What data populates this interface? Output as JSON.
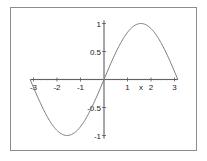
{
  "chart_data": {
    "type": "line",
    "title": "",
    "xlabel": "x",
    "ylabel": "",
    "xlim": [
      -3.1416,
      3.1416
    ],
    "ylim": [
      -1,
      1
    ],
    "grid": false,
    "legend": null,
    "x_ticks": [
      -3,
      -2,
      -1,
      1,
      2,
      3
    ],
    "x_tick_labels": [
      "-3",
      "-2",
      "-1",
      "1",
      "2",
      "3"
    ],
    "y_ticks": [
      1,
      0.5,
      -0.5,
      -1
    ],
    "y_tick_labels": [
      "1",
      "0.5",
      "-0.5",
      "-1"
    ],
    "series": [
      {
        "name": "sin(x)",
        "color": "#7a7a7a",
        "x": [
          -3.1416,
          -2.5,
          -2.0,
          -1.5708,
          -1.0,
          -0.5,
          0,
          0.5,
          1.0,
          1.5708,
          2.0,
          2.5,
          3.1416
        ],
        "y": [
          0,
          -0.598,
          -0.909,
          -1,
          -0.841,
          -0.479,
          0,
          0.479,
          0.841,
          1,
          0.909,
          0.598,
          0
        ]
      }
    ]
  },
  "colors": {
    "frame": "#8c8c8c",
    "axis": "#555555",
    "curve": "#7a7a7a"
  }
}
